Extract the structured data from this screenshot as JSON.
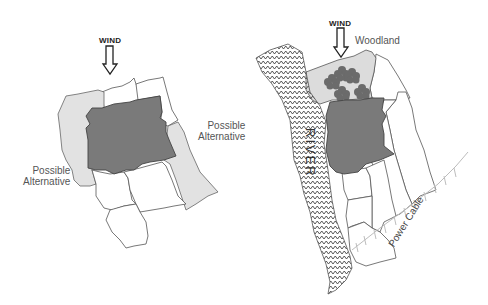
{
  "left_map": {
    "wind_label": "WIND",
    "labels": {
      "alternative_right": [
        "Possible",
        "Alternative"
      ],
      "alternative_left": [
        "Possible",
        "Alternative"
      ]
    }
  },
  "right_map": {
    "wind_label": "WIND",
    "woodland_label": "Woodland",
    "river_label": "RIVER",
    "power_cable_label": "Power Cable"
  },
  "colors": {
    "site_fill": "#7a7a7a",
    "alternative_fill": "#e2e2e2",
    "woodland_fill": "#dcdcdc",
    "tree_fill": "#6b6b6b",
    "outline": "#555555",
    "cable": "#bdbdbd"
  }
}
